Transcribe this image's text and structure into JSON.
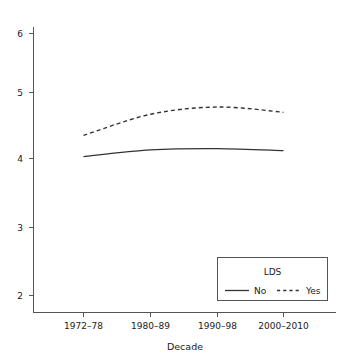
{
  "chart_data": {
    "type": "line",
    "title": "",
    "subtitle": "",
    "xlabel": "Decade",
    "ylabel": "",
    "categories": [
      "1972–78",
      "1980–89",
      "1990–98",
      "2000–2010"
    ],
    "series": [
      {
        "name": "No",
        "style": "solid",
        "color": "#333333",
        "values": [
          4.03,
          4.13,
          4.15,
          4.12
        ]
      },
      {
        "name": "Yes",
        "style": "dashed",
        "color": "#333333",
        "values": [
          4.35,
          4.67,
          4.78,
          4.7
        ]
      }
    ],
    "xlim": [
      -0.5,
      3.5
    ],
    "ylim": [
      1.75,
      6.3
    ],
    "yticks": [
      2,
      3,
      4,
      5,
      6
    ],
    "ytick_labels": [
      "2",
      "3",
      "4",
      "5",
      "6"
    ],
    "grid": false,
    "legend": {
      "title": "LDS",
      "position": "bottom-right",
      "entries": [
        "No",
        "Yes"
      ]
    }
  },
  "axes": {
    "y": {
      "labels": [
        "6",
        "5",
        "4",
        "3",
        "2"
      ]
    },
    "x": {
      "labels": [
        "1972–78",
        "1980–89",
        "1990–98",
        "2000–2010"
      ],
      "title": "Decade"
    }
  },
  "legend": {
    "title": "LDS",
    "entry_no": "No",
    "entry_yes": "Yes"
  }
}
